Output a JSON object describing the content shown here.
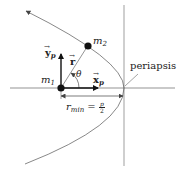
{
  "diagram": {
    "labels": {
      "m1": "m",
      "m1_sub": "1",
      "m2": "m",
      "m2_sub": "2",
      "r_vec": "r",
      "theta": "θ",
      "x_p": "x",
      "x_p_sub": "p",
      "y_p": "y",
      "y_p_sub": "p",
      "r_min": "r",
      "r_min_sub": "min",
      "equals": "=",
      "frac_num": "p",
      "frac_den": "2",
      "periapsis": "periapsis"
    },
    "colors": {
      "line": "#555555",
      "vector": "#111111",
      "mass": "#111111",
      "text": "#222222"
    }
  }
}
